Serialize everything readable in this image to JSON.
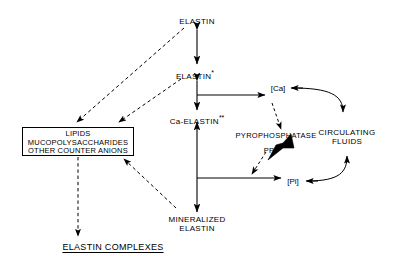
{
  "diagram": {
    "title_bottom": "ELASTIN COMPLEXES",
    "nodes": {
      "elastin": "ELASTIN",
      "elastin_star": "ELASTIN",
      "elastin_star_mark": "*",
      "ca_elastin": "Ca-ELASTIN",
      "ca_elastin_mark": "**",
      "mineralized_line1": "MINERALIZED",
      "mineralized_line2": "ELASTIN",
      "counter_anions_line1": "LIPIDS",
      "counter_anions_line2": "MUCOPOLYSACCHARIDES",
      "counter_anions_line3": "OTHER COUNTER ANIONS",
      "ca_bracket": "[Ca]",
      "pi_bracket": "[Pi]",
      "ppi": "PPi",
      "pyrophosphatase": "PYROPHOSPHATASE",
      "circulating_line1": "CIRCULATING",
      "circulating_line2": "FLUIDS"
    },
    "colors": {
      "stroke": "#000000",
      "background": "#ffffff",
      "text": "#000000"
    }
  }
}
